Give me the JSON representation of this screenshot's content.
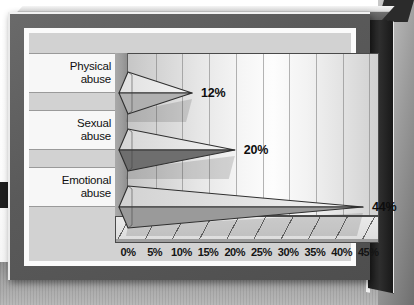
{
  "chart_data": {
    "type": "bar",
    "orientation": "horizontal",
    "style": "3d-cone",
    "title": "",
    "xlabel": "",
    "ylabel": "",
    "categories": [
      "Physical abuse",
      "Sexual abuse",
      "Emotional abuse"
    ],
    "category_lines": [
      [
        "Physical",
        "abuse"
      ],
      [
        "Sexual",
        "abuse"
      ],
      [
        "Emotional",
        "abuse"
      ]
    ],
    "values": [
      12,
      20,
      44
    ],
    "value_labels": [
      "12%",
      "20%",
      "44%"
    ],
    "xlim": [
      0,
      47
    ],
    "xticks": [
      0,
      5,
      10,
      15,
      20,
      25,
      30,
      35,
      40,
      45
    ],
    "xtick_labels": [
      "0%",
      "5%",
      "10%",
      "15%",
      "20%",
      "25%",
      "30%",
      "35%",
      "40%",
      "45%"
    ],
    "grid": "vertical",
    "legend": "none",
    "series": [
      {
        "name": "Percent",
        "values": [
          12,
          20,
          44
        ]
      }
    ]
  },
  "colors": {
    "cone_top_light": "#e3e3e3",
    "cone_top_mid": "#cfcfcf",
    "cone_bottom_light": "#b5b5b5",
    "cone_bottom_dark": "#6e6e6e",
    "cone_outline": "#2f2f2f",
    "wall_light": "#fdfdfd",
    "wall_edge": "#c6c6c6",
    "frame_bezel": "#5a5a5a",
    "mat": "#fbfbfb",
    "card": "#d2d2d2",
    "band": "#f7f7f7",
    "text": "#101010"
  },
  "cone_shading": [
    {
      "top": "#e0e0e0",
      "bottom": "#b0b0b0"
    },
    {
      "top": "#d6d6d6",
      "bottom": "#6e6e6e"
    },
    {
      "top": "#d2d2d2",
      "bottom": "#9a9a9a"
    }
  ]
}
